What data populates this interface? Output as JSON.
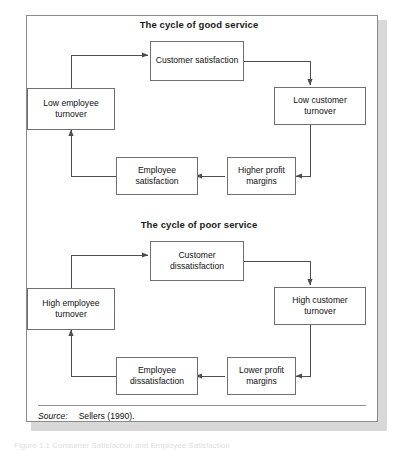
{
  "figure": {
    "caption_partial": "Figure 1.1  Consumer Satisfaction and Employee Satisfaction"
  },
  "sections": [
    {
      "title": "The cycle of good service",
      "nodes": {
        "top": "Customer satisfaction",
        "right": "Low customer turnover",
        "bottom_right": "Higher profit margins",
        "bottom_left": "Employee satisfaction",
        "left": "Low employee turnover"
      }
    },
    {
      "title": "The cycle of poor service",
      "nodes": {
        "top": "Customer dissatisfaction",
        "right": "High customer turnover",
        "bottom_right": "Lower profit margins",
        "bottom_left": "Employee dissatisfaction",
        "left": "High employee turnover"
      }
    }
  ],
  "source": {
    "label": "Source:",
    "text": "Sellers (1990)."
  },
  "colors": {
    "frame_border": "#8a8a8a",
    "box_border": "#6f6f6f",
    "line": "#4d4d4d",
    "text": "#111111",
    "shadow": "#b8b8b8"
  }
}
